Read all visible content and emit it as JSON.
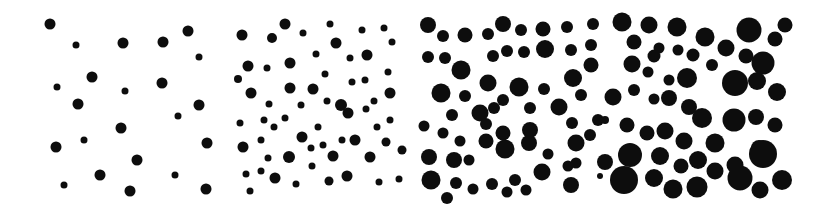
{
  "figure": {
    "panels": [
      {
        "id": "panel-1",
        "dots": [
          [
            50,
            24,
            5.5
          ],
          [
            76,
            45,
            3.5
          ],
          [
            123,
            43,
            5.5
          ],
          [
            163,
            42,
            5.5
          ],
          [
            188,
            31,
            5.5
          ],
          [
            199,
            57,
            3.5
          ],
          [
            92,
            77,
            5.5
          ],
          [
            57,
            87,
            3.5
          ],
          [
            125,
            91,
            3.5
          ],
          [
            162,
            83,
            5.5
          ],
          [
            78,
            104,
            5.5
          ],
          [
            199,
            105,
            5.5
          ],
          [
            178,
            116,
            3.5
          ],
          [
            121,
            128,
            5.5
          ],
          [
            56,
            147,
            5.5
          ],
          [
            84,
            140,
            3.5
          ],
          [
            207,
            143,
            5.5
          ],
          [
            137,
            160,
            5.5
          ],
          [
            100,
            175,
            5.5
          ],
          [
            64,
            185,
            3.5
          ],
          [
            175,
            175,
            3.5
          ],
          [
            130,
            191,
            5.5
          ],
          [
            206,
            189,
            5.5
          ]
        ]
      },
      {
        "id": "panel-2",
        "dots": [
          [
            242,
            35,
            5.5
          ],
          [
            272,
            38,
            5
          ],
          [
            285,
            24,
            5.5
          ],
          [
            303,
            33,
            3.5
          ],
          [
            330,
            24,
            3.5
          ],
          [
            336,
            43,
            5.5
          ],
          [
            362,
            30,
            3.5
          ],
          [
            384,
            28,
            3.5
          ],
          [
            392,
            42,
            3.5
          ],
          [
            316,
            54,
            3.5
          ],
          [
            350,
            58,
            3.5
          ],
          [
            367,
            55,
            5.5
          ],
          [
            248,
            66,
            5.5
          ],
          [
            267,
            68,
            3.5
          ],
          [
            290,
            63,
            5.5
          ],
          [
            325,
            74,
            3.5
          ],
          [
            388,
            72,
            3.5
          ],
          [
            238,
            79,
            4
          ],
          [
            251,
            93,
            5.5
          ],
          [
            290,
            88,
            5.5
          ],
          [
            313,
            89,
            5.5
          ],
          [
            352,
            82,
            3.5
          ],
          [
            365,
            80,
            3.5
          ],
          [
            390,
            93,
            5.5
          ],
          [
            269,
            104,
            3.5
          ],
          [
            301,
            105,
            3.5
          ],
          [
            327,
            101,
            3.5
          ],
          [
            341,
            105,
            6
          ],
          [
            348,
            113,
            5.5
          ],
          [
            366,
            109,
            3.5
          ],
          [
            374,
            101,
            3.5
          ],
          [
            240,
            123,
            3.5
          ],
          [
            264,
            120,
            3.5
          ],
          [
            274,
            127,
            3.5
          ],
          [
            285,
            118,
            3.5
          ],
          [
            318,
            127,
            3.5
          ],
          [
            377,
            127,
            3.5
          ],
          [
            390,
            120,
            3.5
          ],
          [
            402,
            150,
            4.5
          ],
          [
            243,
            147,
            5.5
          ],
          [
            261,
            140,
            3.5
          ],
          [
            302,
            137,
            5.5
          ],
          [
            323,
            145,
            3.5
          ],
          [
            342,
            140,
            3.5
          ],
          [
            355,
            140,
            5.5
          ],
          [
            386,
            142,
            4.5
          ],
          [
            268,
            158,
            3.5
          ],
          [
            289,
            157,
            6
          ],
          [
            311,
            148,
            3.5
          ],
          [
            333,
            156,
            5.5
          ],
          [
            370,
            157,
            5.5
          ],
          [
            246,
            174,
            3.5
          ],
          [
            261,
            171,
            3.5
          ],
          [
            275,
            178,
            5.5
          ],
          [
            312,
            166,
            3.5
          ],
          [
            296,
            184,
            3.5
          ],
          [
            329,
            181,
            4.5
          ],
          [
            347,
            176,
            5.5
          ],
          [
            379,
            182,
            3.5
          ],
          [
            399,
            179,
            3.5
          ],
          [
            250,
            191,
            3.5
          ]
        ]
      },
      {
        "id": "panel-3",
        "dots": [
          [
            428,
            25,
            8
          ],
          [
            443,
            36,
            6
          ],
          [
            465,
            35,
            7.5
          ],
          [
            488,
            34,
            6
          ],
          [
            503,
            24,
            8
          ],
          [
            521,
            30,
            6
          ],
          [
            543,
            29,
            7.5
          ],
          [
            567,
            27,
            6
          ],
          [
            593,
            24,
            6
          ],
          [
            428,
            57,
            6
          ],
          [
            445,
            58,
            6
          ],
          [
            461,
            70,
            9.5
          ],
          [
            493,
            56,
            6
          ],
          [
            507,
            51,
            6
          ],
          [
            524,
            52,
            6
          ],
          [
            545,
            49,
            9
          ],
          [
            571,
            50,
            6
          ],
          [
            591,
            45,
            6
          ],
          [
            591,
            65,
            7.5
          ],
          [
            441,
            93,
            9.5
          ],
          [
            465,
            96,
            6
          ],
          [
            488,
            83,
            8.5
          ],
          [
            503,
            100,
            6
          ],
          [
            519,
            87,
            9.5
          ],
          [
            544,
            89,
            6
          ],
          [
            573,
            78,
            9
          ],
          [
            581,
            95,
            6
          ],
          [
            452,
            115,
            6
          ],
          [
            480,
            113,
            8.5
          ],
          [
            494,
            108,
            6
          ],
          [
            530,
            108,
            6
          ],
          [
            559,
            107,
            8.5
          ],
          [
            486,
            124,
            6
          ],
          [
            424,
            126,
            5.5
          ],
          [
            443,
            133,
            5.5
          ],
          [
            460,
            141,
            5.5
          ],
          [
            486,
            141,
            7.5
          ],
          [
            503,
            133,
            7.5
          ],
          [
            530,
            130,
            8
          ],
          [
            572,
            123,
            6
          ],
          [
            598,
            120,
            6
          ],
          [
            590,
            135,
            6
          ],
          [
            429,
            157,
            8
          ],
          [
            454,
            160,
            8
          ],
          [
            469,
            160,
            5.5
          ],
          [
            505,
            149,
            9.5
          ],
          [
            529,
            143,
            8
          ],
          [
            548,
            154,
            5.5
          ],
          [
            576,
            143,
            8.5
          ],
          [
            576,
            163,
            5.5
          ],
          [
            568,
            166,
            5.5
          ],
          [
            605,
            162,
            8
          ],
          [
            431,
            180,
            9.5
          ],
          [
            456,
            183,
            6
          ],
          [
            473,
            189,
            5.5
          ],
          [
            492,
            184,
            6
          ],
          [
            515,
            180,
            6
          ],
          [
            542,
            172,
            8.5
          ],
          [
            507,
            192,
            5.5
          ],
          [
            526,
            190,
            5.5
          ],
          [
            571,
            185,
            8
          ],
          [
            447,
            198,
            6
          ]
        ]
      },
      {
        "id": "panel-4",
        "dots": [
          [
            622,
            22,
            9.5
          ],
          [
            649,
            25,
            8.5
          ],
          [
            677,
            27,
            9.5
          ],
          [
            705,
            37,
            9.5
          ],
          [
            749,
            30,
            12.5
          ],
          [
            785,
            25,
            7.5
          ],
          [
            634,
            42,
            7.5
          ],
          [
            659,
            48,
            5.5
          ],
          [
            654,
            56,
            6.5
          ],
          [
            678,
            50,
            5.5
          ],
          [
            693,
            55,
            6.5
          ],
          [
            726,
            48,
            8.5
          ],
          [
            746,
            56,
            7.5
          ],
          [
            775,
            39,
            7.5
          ],
          [
            763,
            63,
            11.5
          ],
          [
            632,
            64,
            8.5
          ],
          [
            648,
            72,
            5.5
          ],
          [
            669,
            80,
            5.5
          ],
          [
            687,
            78,
            10
          ],
          [
            712,
            65,
            6
          ],
          [
            735,
            83,
            13
          ],
          [
            757,
            81,
            9
          ],
          [
            777,
            92,
            9
          ],
          [
            613,
            97,
            8.5
          ],
          [
            634,
            90,
            6
          ],
          [
            654,
            99,
            5.5
          ],
          [
            669,
            98,
            8
          ],
          [
            689,
            107,
            8
          ],
          [
            702,
            118,
            10
          ],
          [
            734,
            120,
            11.5
          ],
          [
            756,
            117,
            8
          ],
          [
            775,
            125,
            7.5
          ],
          [
            605,
            120,
            4
          ],
          [
            627,
            125,
            7.5
          ],
          [
            647,
            133,
            7.5
          ],
          [
            665,
            131,
            8.5
          ],
          [
            684,
            141,
            8.5
          ],
          [
            715,
            143,
            9.5
          ],
          [
            759,
            148,
            8
          ],
          [
            630,
            155,
            12
          ],
          [
            660,
            156,
            9
          ],
          [
            681,
            166,
            7.5
          ],
          [
            698,
            160,
            9
          ],
          [
            715,
            171,
            8.5
          ],
          [
            735,
            165,
            8.5
          ],
          [
            763,
            154,
            14
          ],
          [
            740,
            178,
            12.5
          ],
          [
            624,
            180,
            14
          ],
          [
            654,
            178,
            9
          ],
          [
            673,
            189,
            9.5
          ],
          [
            697,
            187,
            10.5
          ],
          [
            760,
            190,
            8.5
          ],
          [
            782,
            180,
            10
          ],
          [
            600,
            176,
            3
          ]
        ]
      }
    ]
  },
  "colors": {
    "dot": "#111111",
    "background": "#ffffff"
  }
}
